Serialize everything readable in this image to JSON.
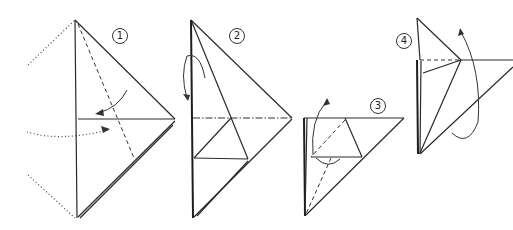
{
  "diagram": {
    "type": "origami-instructions",
    "steps": [
      {
        "number": "1",
        "label": "①",
        "description": "Triangle with dotted original outline on left; valley fold dashed line; fold arrows pointing left"
      },
      {
        "number": "2",
        "label": "②",
        "description": "Narrow flap folded; mountain fold dash-dot horizontal line; curved arrow fold behind"
      },
      {
        "number": "3",
        "label": "③",
        "description": "Trapezoid flap at top of triangle; curved arrow lifting up; dashed valley line"
      },
      {
        "number": "4",
        "label": "④",
        "description": "Tall narrow point raised; dashed horizontal line; large curved arrow upward"
      }
    ],
    "colors": {
      "line": "#2a2a2a",
      "background": "#ffffff"
    }
  }
}
